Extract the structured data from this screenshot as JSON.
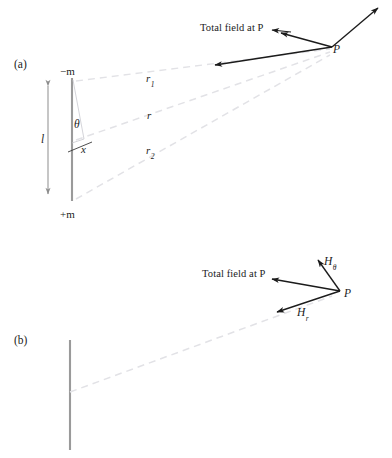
{
  "figure": {
    "panels": [
      {
        "tag": "(a)",
        "tag_pos": {
          "x": 14,
          "y": 59
        },
        "annotations": {
          "total_field": "Total field at P",
          "point": "P",
          "top_charge": "−m",
          "bottom_charge": "+m",
          "length": "l",
          "angle": "θ",
          "offset": "x",
          "ray_top": "r",
          "ray_top_sub": "1",
          "ray_mid": "r",
          "ray_bottom": "r",
          "ray_bottom_sub": "2"
        }
      },
      {
        "tag": "(b)",
        "tag_pos": {
          "x": 14,
          "y": 335
        },
        "annotations": {
          "total_field": "Total field at P",
          "point": "P",
          "h_theta": "H",
          "h_theta_sub": "θ",
          "h_r": "H",
          "h_r_sub": "r"
        }
      }
    ],
    "colors": {
      "stroke": "#1b1b1b",
      "dipole_bar": "#9a9a9a",
      "dashed_ray": "#e2e2e6",
      "dim_arrow": "#8d8d8d",
      "thin_construction": "#c9c9cf",
      "background": "#ffffff"
    },
    "geometry": {
      "panel_a": {
        "bar_x": 72,
        "bar_top_y": 78,
        "bar_bottom_y": 201,
        "dim_arrow_x": 48,
        "p_vertex": {
          "x": 332,
          "y": 47
        },
        "ray_top_end": {
          "x": 330,
          "y": 49
        },
        "ray_mid_end": {
          "x": 330,
          "y": 52
        },
        "ray_bottom_end": {
          "x": 330,
          "y": 55
        }
      },
      "panel_b": {
        "bar_x": 70,
        "bar_top_y": 340,
        "bar_bottom_y": 450,
        "p_vertex": {
          "x": 340,
          "y": 291
        }
      }
    }
  }
}
